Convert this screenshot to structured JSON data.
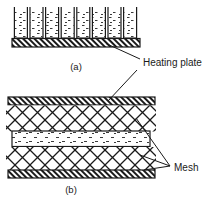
{
  "figure": {
    "type": "technical-cross-section-diagram",
    "width": 215,
    "height": 215,
    "background_color": "#ffffff",
    "line_color": "#1a1a1a",
    "panels": [
      {
        "id": "a",
        "caption": "(a)",
        "caption_x": 76,
        "caption_y": 67,
        "description": "open-cell array on heating plate",
        "cell_count": 8,
        "cells_fill": "stippled",
        "x": 12,
        "y": 6,
        "width": 128,
        "height": 42,
        "plate": {
          "label_ref": "heating-plate",
          "fill": "diagonal-hatch",
          "x": 12,
          "y": 38,
          "width": 128,
          "height": 9
        }
      },
      {
        "id": "b",
        "caption": "(b)",
        "caption_x": 71,
        "caption_y": 190,
        "description": "sandwich: heating plate / mesh / fluid channel / mesh / heating plate",
        "x": 6,
        "y": 97,
        "width": 149,
        "height": 81,
        "layers": [
          {
            "name": "heating-plate-top",
            "fill": "diagonal-hatch",
            "y": 97,
            "height": 8
          },
          {
            "name": "mesh-upper",
            "fill": "diamond-lattice",
            "y": 105,
            "height": 26
          },
          {
            "name": "fluid-channel",
            "fill": "stippled",
            "y": 131,
            "height": 16
          },
          {
            "name": "mesh-lower",
            "fill": "diamond-lattice",
            "y": 147,
            "height": 23
          },
          {
            "name": "heating-plate-bottom",
            "fill": "diagonal-hatch",
            "y": 170,
            "height": 8
          }
        ]
      }
    ],
    "labels": [
      {
        "id": "heating-plate",
        "text": "Heating plate",
        "x": 143,
        "y": 65,
        "leaders": [
          {
            "from_x": 140,
            "from_y": 60,
            "to_x": 106,
            "to_y": 43
          },
          {
            "from_x": 137,
            "from_y": 70,
            "to_x": 108,
            "to_y": 101
          }
        ]
      },
      {
        "id": "mesh",
        "text": "Mesh",
        "x": 174,
        "y": 171,
        "leaders": [
          {
            "from_x": 171,
            "from_y": 166,
            "to_x": 138,
            "to_y": 120
          },
          {
            "from_x": 171,
            "from_y": 166,
            "to_x": 141,
            "to_y": 156
          },
          {
            "from_x": 171,
            "from_y": 166,
            "to_x": 145,
            "to_y": 169
          }
        ]
      }
    ]
  }
}
